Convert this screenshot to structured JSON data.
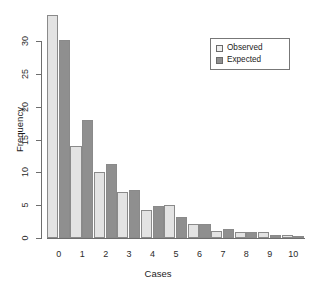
{
  "chart_data": {
    "type": "bar",
    "title": "",
    "xlabel": "Cases",
    "ylabel": "Frequency",
    "categories": [
      "0",
      "1",
      "2",
      "3",
      "4",
      "5",
      "6",
      "7",
      "8",
      "9",
      "10"
    ],
    "series": [
      {
        "name": "Observed",
        "color": "#e3e3e3",
        "values": [
          34,
          14,
          10,
          7,
          4.2,
          5.1,
          2.2,
          1.1,
          0.9,
          0.9,
          0.4
        ]
      },
      {
        "name": "Expected",
        "color": "#8f8f8f",
        "values": [
          30.2,
          17.9,
          11.3,
          7.3,
          4.8,
          3.2,
          2.2,
          1.4,
          0.9,
          0.5,
          0.3
        ]
      }
    ],
    "ylim": [
      0,
      34
    ],
    "yticks": [
      0,
      5,
      10,
      15,
      20,
      25,
      30
    ],
    "ytick_labels": [
      "0",
      "5",
      "10",
      "15",
      "20",
      "25",
      "30"
    ],
    "xtick_labels": [
      "0",
      "1",
      "2",
      "3",
      "4",
      "5",
      "6",
      "7",
      "8",
      "9",
      "10"
    ],
    "grid": false,
    "legend_position": "top-right",
    "legend_entries": [
      "Observed",
      "Expected"
    ]
  },
  "legend": {
    "observed_label": "Observed",
    "expected_label": "Expected"
  },
  "axes": {
    "x_title": "Cases",
    "y_title": "Frequency"
  }
}
